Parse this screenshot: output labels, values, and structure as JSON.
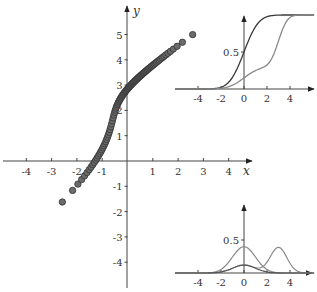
{
  "chart_data": [
    {
      "type": "scatter",
      "title": "",
      "xlabel": "x",
      "ylabel": "y",
      "xlim": [
        -5,
        5
      ],
      "ylim": [
        -5,
        5.6
      ],
      "xticks": [
        -4,
        -3,
        -2,
        -1,
        1,
        2,
        3,
        4
      ],
      "yticks": [
        -4,
        -3,
        -2,
        -1,
        1,
        2,
        3,
        4,
        5
      ],
      "grid": false,
      "description": "Q-Q style plot: quantiles of N(0,1) (x) vs quantiles of a bimodal mixture (y)",
      "points_sample": [
        {
          "x": -3.1,
          "y": -2.7
        },
        {
          "x": -2.3,
          "y": -1.8
        },
        {
          "x": -2.05,
          "y": -1.5
        },
        {
          "x": -1.2,
          "y": 0.0
        },
        {
          "x": -0.7,
          "y": 1.0
        },
        {
          "x": -0.5,
          "y": 2.0
        },
        {
          "x": 0.0,
          "y": 2.7
        },
        {
          "x": 1.0,
          "y": 3.5
        },
        {
          "x": 1.95,
          "y": 4.4
        },
        {
          "x": 2.25,
          "y": 4.6
        }
      ]
    },
    {
      "type": "line",
      "title": "CDF inset",
      "xticks": [
        -4,
        -2,
        0,
        2,
        4
      ],
      "yticks": [
        0.5
      ],
      "series": [
        {
          "name": "N(0,1) CDF",
          "color": "#333333",
          "x": [
            -4,
            -2,
            -1,
            0,
            1,
            2,
            4
          ],
          "values": [
            0,
            0.02,
            0.16,
            0.5,
            0.84,
            0.98,
            1
          ]
        },
        {
          "name": "mixture CDF",
          "color": "#888888",
          "x": [
            -4,
            -2,
            -1,
            0,
            1,
            2,
            3,
            4
          ],
          "values": [
            0,
            0.01,
            0.05,
            0.15,
            0.25,
            0.32,
            0.65,
            0.98
          ]
        }
      ]
    },
    {
      "type": "line",
      "title": "PDF inset",
      "xticks": [
        -4,
        -2,
        0,
        2,
        4
      ],
      "yticks": [
        0.5
      ],
      "series": [
        {
          "name": "N(0,1) PDF",
          "color": "#888888",
          "x": [
            -3,
            -2,
            -1,
            0,
            1,
            2,
            3
          ],
          "values": [
            0.004,
            0.054,
            0.242,
            0.399,
            0.242,
            0.054,
            0.004
          ]
        },
        {
          "name": "mixture PDF",
          "color": "#888888",
          "x": [
            -2,
            0,
            1.5,
            3,
            4.5
          ],
          "values": [
            0.02,
            0.12,
            0.07,
            0.39,
            0.02
          ]
        },
        {
          "name": "weighted component",
          "color": "#555555",
          "x": [
            -2,
            0,
            2
          ],
          "values": [
            0.015,
            0.12,
            0.015
          ]
        }
      ]
    }
  ],
  "labels": {
    "x_axis": "x",
    "y_axis": "y",
    "main_x_ticks": [
      "-4",
      "-3",
      "-2",
      "-1",
      "1",
      "2",
      "3",
      "4"
    ],
    "main_y_ticks": [
      "5",
      "4",
      "3",
      "2",
      "1",
      "-1",
      "-2",
      "-3",
      "-4"
    ],
    "inset_x_ticks": [
      "-4",
      "-2",
      "0",
      "2",
      "4"
    ],
    "inset_y_tick": "0.5"
  }
}
